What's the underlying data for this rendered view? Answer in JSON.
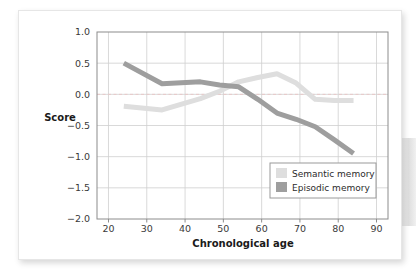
{
  "figure": {
    "background_color": "#ffffff",
    "card_border_color": "#e6e6e6"
  },
  "chart_data": {
    "type": "line",
    "title": "",
    "xlabel": "Chronological age",
    "ylabel": "Score",
    "xlim": [
      17,
      93
    ],
    "ylim": [
      -2.0,
      1.0
    ],
    "xticks": [
      20,
      30,
      40,
      50,
      60,
      70,
      80,
      90
    ],
    "xtick_labels": [
      "20",
      "30",
      "40",
      "50",
      "60",
      "70",
      "80",
      "90"
    ],
    "yticks": [
      1.0,
      0.5,
      0.0,
      -0.5,
      -1.0,
      -1.5,
      -2.0
    ],
    "ytick_labels": [
      "1.0",
      "0.5",
      "0.0",
      "−0.5",
      "−1.0",
      "−1.5",
      "−2.0"
    ],
    "grid": true,
    "grid_color": "#cfcfcf",
    "zero_reference_line": {
      "value": 0.0,
      "style": "dashed",
      "color": "#e8c8c8"
    },
    "legend_position": "lower right",
    "series": [
      {
        "name": "Semantic memory",
        "color": "#dedede",
        "line_width": 5,
        "x": [
          24,
          34,
          44,
          49,
          54,
          59,
          64,
          69,
          74,
          79,
          84
        ],
        "values": [
          -0.19,
          -0.25,
          -0.07,
          0.05,
          0.2,
          0.27,
          0.33,
          0.18,
          -0.08,
          -0.1,
          -0.1
        ]
      },
      {
        "name": "Episodic memory",
        "color": "#9e9e9e",
        "line_width": 5,
        "x": [
          24,
          34,
          44,
          49,
          54,
          59,
          64,
          69,
          74,
          79,
          84
        ],
        "values": [
          0.5,
          0.17,
          0.2,
          0.15,
          0.12,
          -0.08,
          -0.3,
          -0.4,
          -0.52,
          -0.73,
          -0.95
        ]
      }
    ]
  },
  "legend": {
    "items": [
      {
        "label": "Semantic memory",
        "swatch_color": "#dedede"
      },
      {
        "label": "Episodic memory",
        "swatch_color": "#9e9e9e"
      }
    ],
    "border_color": "#9a9a9a",
    "background_color": "#ffffff"
  }
}
